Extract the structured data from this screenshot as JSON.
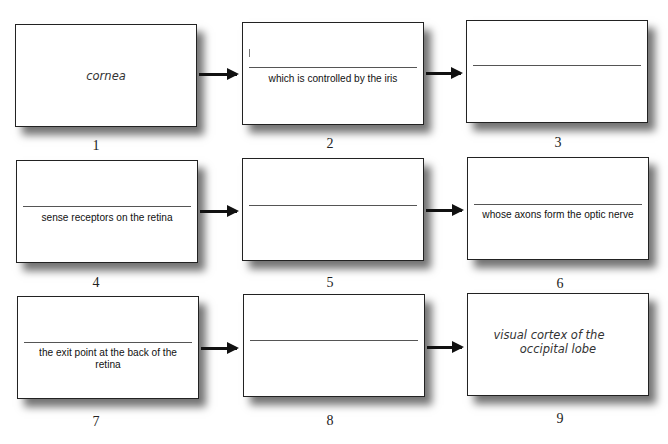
{
  "steps": [
    {
      "number": "1",
      "label": "cornea",
      "style": "italic-center"
    },
    {
      "number": "2",
      "label": "which is controlled by the iris",
      "style": "fill-in",
      "blank": ""
    },
    {
      "number": "3",
      "label": "",
      "style": "fill-in",
      "blank": ""
    },
    {
      "number": "4",
      "label": "sense receptors on the retina",
      "style": "fill-in",
      "blank": ""
    },
    {
      "number": "5",
      "label": "",
      "style": "fill-in",
      "blank": ""
    },
    {
      "number": "6",
      "label": "whose axons form the optic nerve",
      "style": "fill-in",
      "blank": ""
    },
    {
      "number": "7",
      "label": "the exit point at the back of the retina",
      "style": "fill-in",
      "blank": ""
    },
    {
      "number": "8",
      "label": "",
      "style": "fill-in",
      "blank": ""
    },
    {
      "number": "9",
      "label_line1": "visual cortex of the",
      "label_line2": "occipital lobe",
      "style": "italic-center"
    }
  ],
  "flow": [
    "1->2",
    "2->3",
    "4->5",
    "5->6",
    "7->8",
    "8->9"
  ]
}
